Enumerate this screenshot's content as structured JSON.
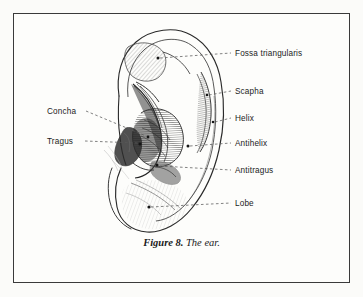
{
  "figure": {
    "caption_prefix": "Figure 8.",
    "caption_title": "The ear."
  },
  "colors": {
    "paper": "#fbfbf9",
    "plate": "#fdfdfb",
    "frame": "#3a3a3a",
    "ink": "#1c1c1c",
    "leader": "#555555",
    "shading": "#444444"
  },
  "labels": {
    "right": [
      {
        "id": "fossa-triangularis",
        "text": "Fossa triangularis",
        "x": 235,
        "y": 55,
        "dot_x": 158,
        "dot_y": 58
      },
      {
        "id": "scapha",
        "text": "Scapha",
        "x": 235,
        "y": 93,
        "dot_x": 207,
        "dot_y": 95
      },
      {
        "id": "helix",
        "text": "Helix",
        "x": 235,
        "y": 120,
        "dot_x": 213,
        "dot_y": 122
      },
      {
        "id": "antihelix",
        "text": "Antihelix",
        "x": 235,
        "y": 145,
        "dot_x": 188,
        "dot_y": 146
      },
      {
        "id": "antitragus",
        "text": "Antitragus",
        "x": 235,
        "y": 172,
        "dot_x": 157,
        "dot_y": 165
      },
      {
        "id": "lobe",
        "text": "Lobe",
        "x": 235,
        "y": 205,
        "dot_x": 149,
        "dot_y": 207
      }
    ],
    "left": [
      {
        "id": "concha",
        "text": "Concha",
        "x": 47,
        "y": 113,
        "dot_x": 148,
        "dot_y": 138
      },
      {
        "id": "tragus",
        "text": "Tragus",
        "x": 47,
        "y": 143,
        "dot_x": 140,
        "dot_y": 145
      }
    ]
  }
}
